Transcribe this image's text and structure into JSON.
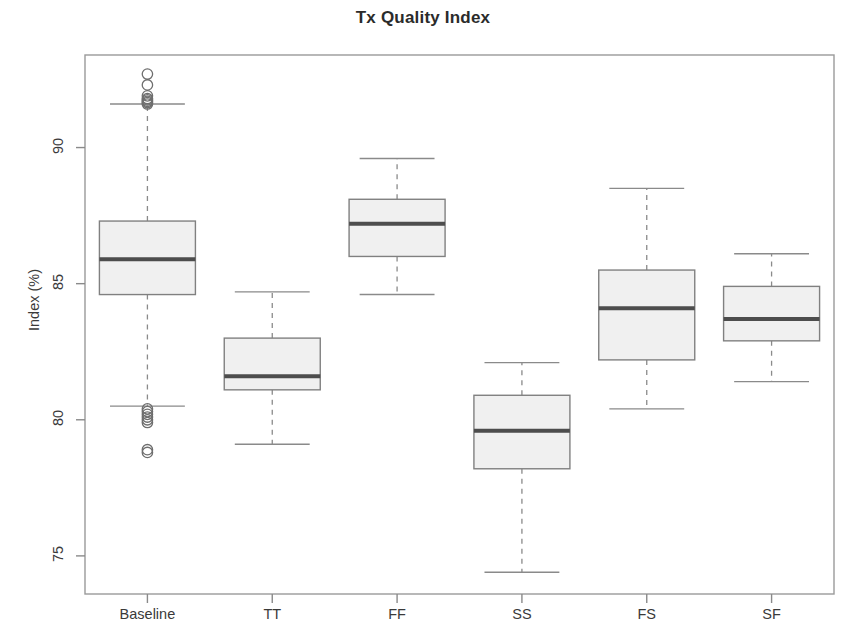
{
  "chart": {
    "title": "Tx Quality Index",
    "ylabel": "Index (%)",
    "xlabel": ""
  },
  "axis": {
    "y_ticks": [
      "75",
      "80",
      "85",
      "90"
    ],
    "x_ticks": [
      "Baseline",
      "TT",
      "FF",
      "SS",
      "FS",
      "SF"
    ]
  },
  "chart_data": {
    "type": "box",
    "title": "Tx Quality Index",
    "xlabel": "",
    "ylabel": "Index (%)",
    "ylim": [
      73.6,
      93.4
    ],
    "y_tick_values": [
      75,
      80,
      85,
      90
    ],
    "grid": false,
    "legend": "none",
    "box_fill_color": "#f0f0f0",
    "box_border_color": "#808080",
    "median_color": "#4d4d4d",
    "whisker_style": "dashed",
    "categories": [
      "Baseline",
      "TT",
      "FF",
      "SS",
      "FS",
      "SF"
    ],
    "boxes": [
      {
        "category": "Baseline",
        "whisker_low": 80.5,
        "q1": 84.6,
        "median": 85.9,
        "q3": 87.3,
        "whisker_high": 91.6,
        "outliers": [
          92.7,
          92.3,
          91.9,
          91.8,
          91.75,
          91.7,
          91.65,
          91.6,
          80.4,
          80.3,
          80.2,
          80.1,
          80.0,
          79.9,
          78.9,
          78.8
        ]
      },
      {
        "category": "TT",
        "whisker_low": 79.1,
        "q1": 81.1,
        "median": 81.6,
        "q3": 83.0,
        "whisker_high": 84.7,
        "outliers": []
      },
      {
        "category": "FF",
        "whisker_low": 84.6,
        "q1": 86.0,
        "median": 87.2,
        "q3": 88.1,
        "whisker_high": 89.6,
        "outliers": []
      },
      {
        "category": "SS",
        "whisker_low": 74.4,
        "q1": 78.2,
        "median": 79.6,
        "q3": 80.9,
        "whisker_high": 82.1,
        "outliers": []
      },
      {
        "category": "FS",
        "whisker_low": 80.4,
        "q1": 82.2,
        "median": 84.1,
        "q3": 85.5,
        "whisker_high": 88.5,
        "outliers": []
      },
      {
        "category": "SF",
        "whisker_low": 81.4,
        "q1": 82.9,
        "median": 83.7,
        "q3": 84.9,
        "whisker_high": 86.1,
        "outliers": []
      }
    ]
  }
}
